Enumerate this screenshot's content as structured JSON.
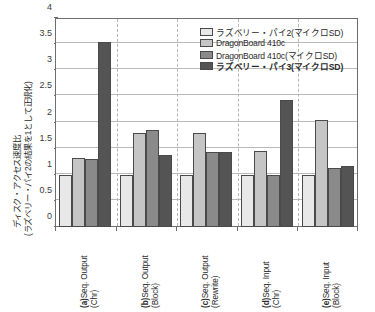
{
  "chart_data": {
    "type": "bar",
    "title": "",
    "xlabel": "",
    "ylabel": "ディスク・アクセス速度比\n(ラズベリー・パイ2の結果を1として正規化)",
    "ylabel_line1": "ディスク・アクセス速度比",
    "ylabel_line2": "(ラズベリー・パイ2の結果を1として正規化)",
    "ylim": [
      0,
      4
    ],
    "yticks": [
      0,
      0.5,
      1,
      1.5,
      2,
      2.5,
      3,
      3.5,
      4
    ],
    "ytick_labels": [
      "0",
      "0.5",
      "1",
      "1.5",
      "2",
      "2.5",
      "3",
      "3.5",
      "4"
    ],
    "grid": true,
    "legend_position": "top-right",
    "categories": [
      "(a)Seq. Output (Chr)",
      "(b)Seq. Output (Block)",
      "(c)Seq. Output (Rewrite)",
      "(d)Seq. Input (Chr)",
      "(e)Seq. Input (Block)"
    ],
    "category_lines": [
      {
        "line1_prefix": "(a)",
        "line1": "Seq. Output",
        "line2": "(Chr)"
      },
      {
        "line1_prefix": "(b)",
        "line1": "Seq. Output",
        "line2": "(Block)"
      },
      {
        "line1_prefix": "(c)",
        "line1": "Seq. Output",
        "line2": "(Rewrite)"
      },
      {
        "line1_prefix": "(d)",
        "line1": "Seq. Input",
        "line2": "(Chr)"
      },
      {
        "line1_prefix": "(e)",
        "line1": "Seq. Input",
        "line2": "(Block)"
      }
    ],
    "series": [
      {
        "name": "ラズベリー・パイ2(マイクロSD)",
        "color": "#e8e8e8",
        "bold": false,
        "values": [
          1.0,
          1.0,
          1.0,
          1.0,
          1.0
        ]
      },
      {
        "name": "DragonBoard 410c",
        "color": "#c5c5c5",
        "bold": false,
        "values": [
          1.33,
          1.8,
          1.8,
          1.46,
          2.05
        ]
      },
      {
        "name": "DragonBoard 410c(マイクロSD)",
        "color": "#8a8a8a",
        "bold": false,
        "values": [
          1.31,
          1.86,
          1.44,
          1.0,
          1.13
        ]
      },
      {
        "name": "ラズベリー・パイ3(マイクロSD)",
        "color": "#545454",
        "bold": true,
        "values": [
          3.55,
          1.37,
          1.44,
          2.43,
          1.17
        ]
      }
    ]
  }
}
